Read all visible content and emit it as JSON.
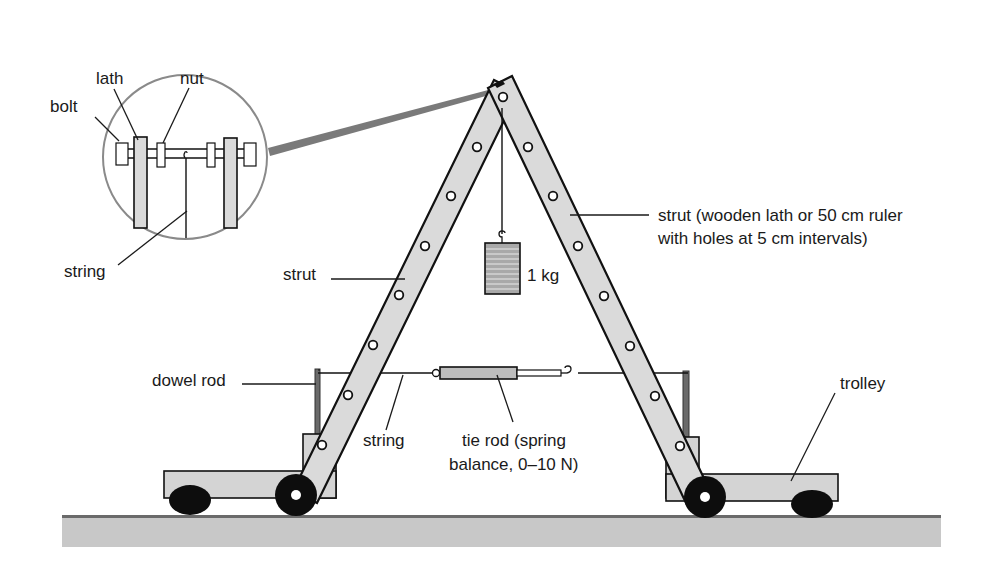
{
  "colors": {
    "background": "#ffffff",
    "strut_fill": "#dadada",
    "outline": "#111111",
    "trolley_fill": "#d4d4d4",
    "ground_fill": "#c8c8c8",
    "ground_edge": "#6a6a6a",
    "wheel": "#0d0d0d",
    "magnifier_ring": "#8a8a8a",
    "zoom_beam": "#7a7a7a",
    "dowel": "#6a6a6a"
  },
  "labels": {
    "lath": "lath",
    "nut": "nut",
    "bolt": "bolt",
    "string_inset": "string",
    "strut_left": "strut",
    "strut_right_line1": "strut (wooden lath or 50 cm ruler",
    "strut_right_line2": "with holes at 5 cm intervals)",
    "mass": "1 kg",
    "dowel_rod": "dowel rod",
    "string_tie": "string",
    "tie_rod_line1": "tie rod (spring",
    "tie_rod_line2": "balance, 0–10 N)",
    "trolley": "trolley"
  },
  "components": {
    "struts": {
      "count": 2,
      "hole_spacing": "5 cm",
      "length": "50 cm"
    },
    "mass": {
      "value": "1 kg"
    },
    "spring_balance": {
      "range": "0–10 N"
    },
    "trolleys": 2,
    "dowel_rods": 2
  }
}
